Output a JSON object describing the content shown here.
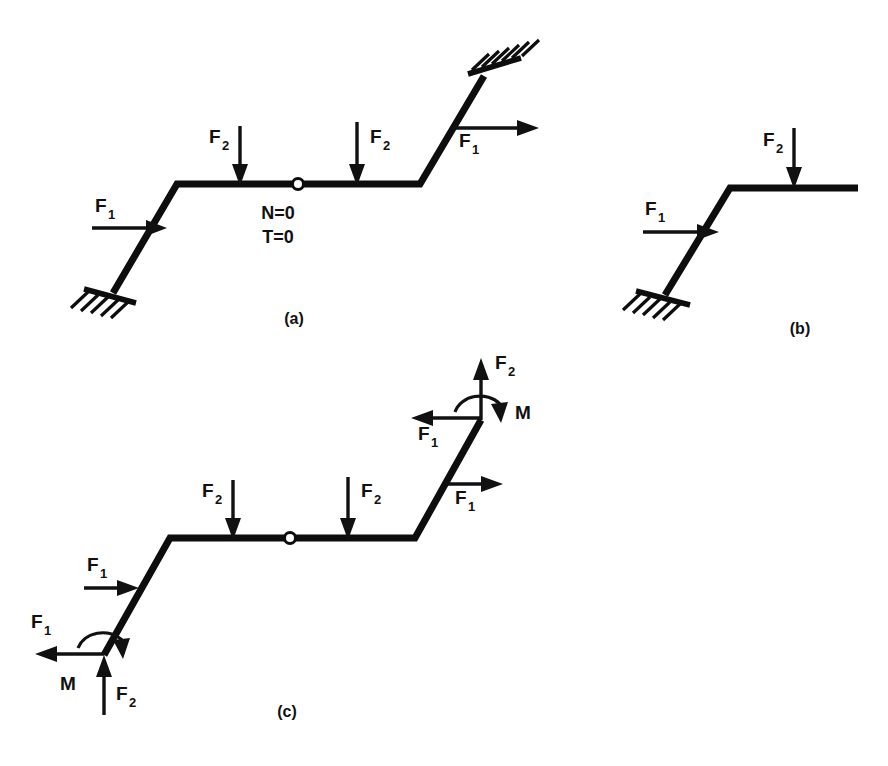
{
  "figure": {
    "background_color": "#ffffff",
    "ink_color": "#111111",
    "panels": [
      {
        "id": "a",
        "caption": "(a)",
        "description": "Complete frame with fixed supports at both ends and an internal hinge",
        "annotations": [
          "N=0",
          "T=0"
        ],
        "loads": [
          "F_1",
          "F_2",
          "F_2",
          "F_1"
        ]
      },
      {
        "id": "b",
        "caption": "(b)",
        "description": "Left segment isolated, fixed support at base",
        "loads": [
          "F_1",
          "F_2"
        ]
      },
      {
        "id": "c",
        "caption": "(c)",
        "description": "Whole frame free body with support reactions replaced by forces and moments",
        "loads": [
          "F_1",
          "F_2",
          "F_2",
          "F_1",
          "F_1",
          "F_2",
          "M",
          "F_1",
          "F_2",
          "M"
        ]
      }
    ]
  },
  "labels": {
    "F": "F",
    "sub1": "1",
    "sub2": "2",
    "M": "M",
    "N_zero": "N=0",
    "T_zero": "T=0",
    "panel_a": "(a)",
    "panel_b": "(b)",
    "panel_c": "(c)"
  },
  "panel_a": {
    "caption": "(a)",
    "note_line1": "N=0",
    "note_line2": "T=0",
    "force_left_F": "F",
    "force_left_sub": "1",
    "force_mid1_F": "F",
    "force_mid1_sub": "2",
    "force_mid2_F": "F",
    "force_mid2_sub": "2",
    "force_right_F": "F",
    "force_right_sub": "1"
  },
  "panel_b": {
    "caption": "(b)",
    "force_left_F": "F",
    "force_left_sub": "1",
    "force_top_F": "F",
    "force_top_sub": "2"
  },
  "panel_c": {
    "caption": "(c)",
    "force_mid1_F": "F",
    "force_mid1_sub": "2",
    "force_mid2_F": "F",
    "force_mid2_sub": "2",
    "force_incline_left_F": "F",
    "force_incline_left_sub": "1",
    "force_upper_right_F": "F",
    "force_upper_right_sub": "1",
    "reaction_top_vert_F": "F",
    "reaction_top_vert_sub": "2",
    "reaction_top_horiz_F": "F",
    "reaction_top_horiz_sub": "1",
    "reaction_top_moment": "M",
    "reaction_bot_horiz_F": "F",
    "reaction_bot_horiz_sub": "1",
    "reaction_bot_vert_F": "F",
    "reaction_bot_vert_sub": "2",
    "reaction_bot_moment": "M"
  }
}
